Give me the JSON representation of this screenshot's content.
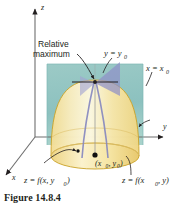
{
  "figure": {
    "caption": "Figure 14.8.4",
    "axes": {
      "z_label": "z",
      "y_label": "y",
      "x_label": "x"
    },
    "annotations": {
      "relative_max_line1": "Relative",
      "relative_max_line2": "maximum",
      "plane_y": "y = y",
      "plane_y_sub": "0",
      "plane_x": "x = x",
      "plane_x_sub": "0",
      "point_open": "(x",
      "point_sub1": "0",
      "point_mid": ", y",
      "point_sub2": "0",
      "point_close": ")",
      "curve_left": "z = f(x, y",
      "curve_left_sub": "0",
      "curve_left_close": ")",
      "curve_right": "z = f(x",
      "curve_right_sub": "0",
      "curve_right_mid": ", y)",
      "curve_right_close": ""
    },
    "colors": {
      "background_plane": "#8fc4c2",
      "surface_fill": "#f7e8a8",
      "surface_fill_light": "#fdf6d8",
      "surface_edge": "#c9a227",
      "cut_plane": "#9a9ad0",
      "axis": "#6e6e6e",
      "text": "#231f20",
      "page_background": "#ffffff"
    }
  }
}
